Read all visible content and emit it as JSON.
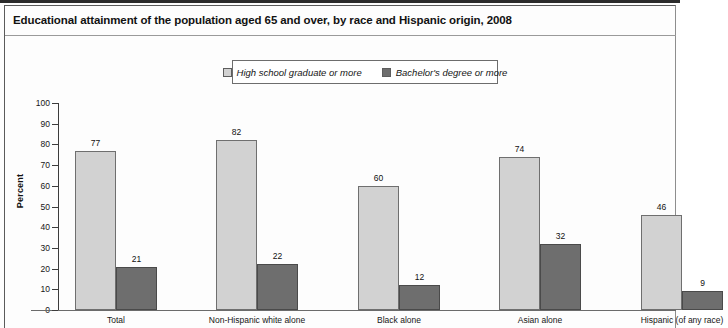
{
  "title": "Educational attainment of the population aged 65 and over, by race and Hispanic origin, 2008",
  "legend": {
    "items": [
      {
        "label": "High school graduate or more",
        "swatch": "#d2d2d2",
        "icon": "legend-swatch-light"
      },
      {
        "label": "Bachelor's degree or more",
        "swatch": "#6e6e6e",
        "icon": "legend-swatch-dark"
      }
    ]
  },
  "axes": {
    "ylabel": "Percent",
    "yticks": [
      "100",
      "90",
      "80",
      "70",
      "60",
      "50",
      "40",
      "30",
      "20",
      "10",
      "0"
    ]
  },
  "chart_data": {
    "type": "bar",
    "title": "Educational attainment of the population aged 65 and over, by race and Hispanic origin, 2008",
    "xlabel": "",
    "ylabel": "Percent",
    "ylim": [
      0,
      100
    ],
    "ytick_step": 10,
    "grid": false,
    "legend_position": "top-center",
    "categories": [
      "Total",
      "Non-Hispanic white alone",
      "Black alone",
      "Asian alone",
      "Hispanic (of any race)"
    ],
    "series": [
      {
        "name": "High school graduate or more",
        "color": "#d2d2d2",
        "values": [
          77,
          82,
          60,
          74,
          46
        ]
      },
      {
        "name": "Bachelor's degree or more",
        "color": "#6e6e6e",
        "values": [
          21,
          22,
          12,
          32,
          9
        ]
      }
    ]
  }
}
